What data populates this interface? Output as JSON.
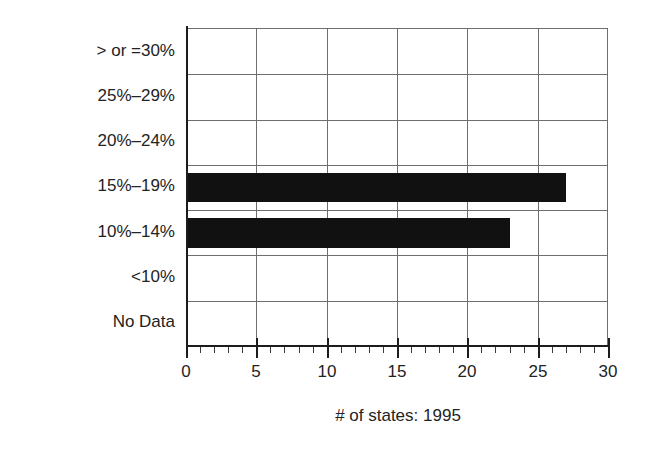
{
  "chart_data": {
    "type": "bar",
    "orientation": "horizontal",
    "title": "",
    "xlabel": "# of states: 1995",
    "ylabel": "% of population obese",
    "categories": [
      "No Data",
      "<10%",
      "10%–14%",
      "15%–19%",
      "20%–24%",
      "25%–29%",
      "> or =30%"
    ],
    "values": [
      0,
      0,
      23,
      27,
      0,
      0,
      0
    ],
    "xlim": [
      0,
      30
    ],
    "xticks": [
      0,
      5,
      10,
      15,
      20,
      25,
      30
    ],
    "xtick_labels": [
      "0",
      "5",
      "10",
      "15",
      "20",
      "25",
      "30"
    ],
    "minor_tick_interval": 1,
    "grid": true,
    "grid_axis": "both",
    "legend": false,
    "bar_color": "#111111",
    "grid_color": "#6e6e6e",
    "axis_color": "#1c1c1c",
    "text_color": "#232323",
    "background": "#ffffff",
    "series": [
      {
        "name": "# of states: 1995",
        "values": [
          0,
          0,
          23,
          27,
          0,
          0,
          0
        ]
      }
    ],
    "points": [
      {
        "category": "No Data",
        "value": 0
      },
      {
        "category": "<10%",
        "value": 0
      },
      {
        "category": "10%–14%",
        "value": 23
      },
      {
        "category": "15%–19%",
        "value": 27
      },
      {
        "category": "20%–24%",
        "value": 0
      },
      {
        "category": "25%–29%",
        "value": 0
      },
      {
        "category": "> or =30%",
        "value": 0
      }
    ]
  },
  "axes": {
    "y_title": "% of population obese",
    "x_title": "# of states: 1995",
    "y_labels_top_to_bottom": [
      "> or =30%",
      "25%–29%",
      "20%–24%",
      "15%–19%",
      "10%–14%",
      "<10%",
      "No Data"
    ],
    "x_labels": [
      "0",
      "5",
      "10",
      "15",
      "20",
      "25",
      "30"
    ]
  }
}
